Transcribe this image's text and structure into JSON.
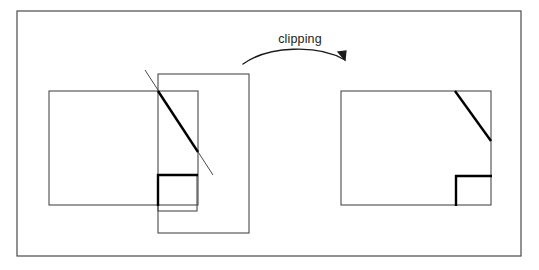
{
  "figure": {
    "kind": "geometry-diagram",
    "title_text": "clipping",
    "background_color": "#ffffff",
    "stroke_color": "#4a4a4a",
    "bold_stroke_color": "#000000",
    "outer_border": {
      "name": "figure-frame",
      "x": 17,
      "y": 11,
      "width": 504,
      "height": 245,
      "stroke_width": 1.2
    },
    "annotation": {
      "label": "clipping",
      "label_x": 300,
      "label_y": 40,
      "arrow_path": "M 243 64 C 268 46, 318 44, 345 60",
      "arrow_head_points": "345,60 338,52 346,51",
      "arrow_stroke_width": 1.4
    },
    "left_panel": {
      "name": "before-clipping-panel",
      "clip_window": {
        "name": "clip-window-rect",
        "x": 49,
        "y": 91,
        "width": 149,
        "height": 114,
        "stroke_width": 1.1
      },
      "scene_rect": {
        "name": "scene-boundary-rect",
        "x": 158,
        "y": 74,
        "width": 91,
        "height": 159,
        "stroke_width": 1.1
      },
      "diagonal_full": {
        "name": "diagonal-line-unclipped",
        "x1": 145,
        "y1": 70,
        "x2": 213,
        "y2": 175,
        "stroke_width": 1.0
      },
      "diagonal_inside": {
        "name": "diagonal-line-inside-clip",
        "x1": 158,
        "y1": 91,
        "x2": 198,
        "y2": 152,
        "stroke_width": 2.4
      },
      "square": {
        "name": "small-square-unclipped",
        "x": 158,
        "y": 175,
        "width": 39,
        "height": 36,
        "stroke_width": 1.1
      },
      "square_inside_top": {
        "name": "small-square-top-edge-inside",
        "x1": 157,
        "y1": 175,
        "x2": 198,
        "y2": 175,
        "stroke_width": 2.4
      },
      "square_inside_left": {
        "name": "small-square-left-edge-inside",
        "x1": 158,
        "y1": 174,
        "x2": 158,
        "y2": 206,
        "stroke_width": 2.4
      }
    },
    "right_panel": {
      "name": "after-clipping-panel",
      "clip_window": {
        "name": "clipped-result-rect",
        "x": 341,
        "y": 91,
        "width": 150,
        "height": 114,
        "stroke_width": 1.1
      },
      "diagonal_clipped": {
        "name": "diagonal-line-clipped",
        "x1": 455,
        "y1": 91,
        "x2": 491,
        "y2": 141,
        "stroke_width": 2.4
      },
      "square_top": {
        "name": "clipped-square-top-edge",
        "x1": 455,
        "y1": 176,
        "x2": 492,
        "y2": 176,
        "stroke_width": 2.4
      },
      "square_left": {
        "name": "clipped-square-left-edge",
        "x1": 456,
        "y1": 175,
        "x2": 456,
        "y2": 206,
        "stroke_width": 2.4
      }
    }
  }
}
